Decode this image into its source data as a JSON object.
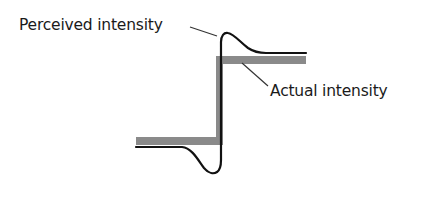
{
  "diagram": {
    "labels": {
      "perceived": "Perceived intensity",
      "actual": "Actual intensity"
    },
    "colors": {
      "background": "#ffffff",
      "actual_band": "#8a8a8a",
      "perceived_curve": "#111111",
      "text": "#1a1a1a",
      "leader_line": "#333333"
    },
    "series": [
      {
        "name": "Actual intensity",
        "style": "thick gray step",
        "levels": [
          "low",
          "high"
        ]
      },
      {
        "name": "Perceived intensity",
        "style": "thin black curve with undershoot and overshoot at edge"
      }
    ]
  }
}
